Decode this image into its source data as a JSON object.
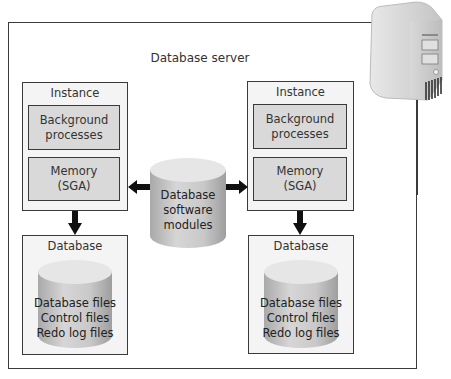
{
  "diagram": {
    "title": "Database server",
    "server_icon": "server-tower-icon",
    "center_cylinder": {
      "lines": [
        "Database",
        "software",
        "modules"
      ]
    },
    "instances": [
      {
        "label": "Instance",
        "background": [
          "Background",
          "processes"
        ],
        "memory": [
          "Memory",
          "(SGA)"
        ]
      },
      {
        "label": "Instance",
        "background": [
          "Background",
          "processes"
        ],
        "memory": [
          "Memory",
          "(SGA)"
        ]
      }
    ],
    "databases": [
      {
        "label": "Database",
        "files": [
          "Database files",
          "Control files",
          "Redo log files"
        ]
      },
      {
        "label": "Database",
        "files": [
          "Database files",
          "Control files",
          "Redo log files"
        ]
      }
    ],
    "colors": {
      "border": "#3a3a3a",
      "panel": "#f4f4f4",
      "inner_box": "#d9d9d9",
      "cylinder": "#c8c8c8"
    }
  }
}
